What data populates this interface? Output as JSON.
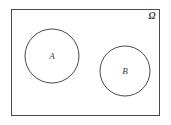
{
  "figure": {
    "width": 171,
    "height": 125,
    "background_color": "#ffffff",
    "stroke_color": "#4a4a4a",
    "label_color": "#3a3a3a"
  },
  "universe": {
    "label": "Ω",
    "label_name": "omega",
    "shape": "rectangle",
    "x": 11,
    "y": 9,
    "width": 149,
    "height": 107,
    "label_x": 152,
    "label_y": 17
  },
  "sets": [
    {
      "label": "A",
      "shape": "circle",
      "cx": 52,
      "cy": 56,
      "r": 27,
      "label_x": 52,
      "label_y": 57
    },
    {
      "label": "B",
      "shape": "circle",
      "cx": 125,
      "cy": 71,
      "r": 25,
      "label_x": 125,
      "label_y": 72
    }
  ],
  "relation": {
    "description": "disjoint",
    "overlap": false
  }
}
